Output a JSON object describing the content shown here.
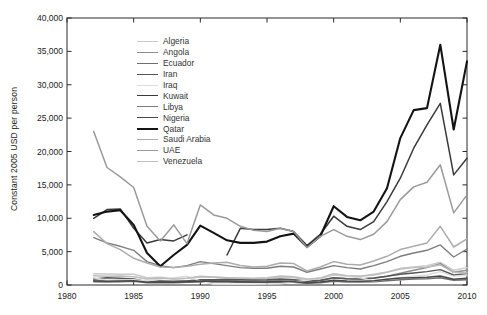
{
  "figure": {
    "ylabel": "Constant 2005 USD per person",
    "axis_color": "#2b2b2b",
    "background": "#ffffff"
  },
  "chart_data": {
    "type": "line",
    "title": "",
    "xlabel": "",
    "ylabel": "Constant 2005 USD per person",
    "xlim": [
      1980,
      2010
    ],
    "ylim": [
      0,
      40000
    ],
    "xticks": [
      1980,
      1985,
      1990,
      1995,
      2000,
      2005,
      2010
    ],
    "yticks": [
      0,
      5000,
      10000,
      15000,
      20000,
      25000,
      30000,
      35000,
      40000
    ],
    "ytick_labels": [
      "0",
      "5,000",
      "10,000",
      "15,000",
      "20,000",
      "25,000",
      "30,000",
      "35,000",
      "40,000"
    ],
    "grid": false,
    "legend_position": "upper-left-inside",
    "x": [
      1982,
      1983,
      1984,
      1985,
      1986,
      1987,
      1988,
      1989,
      1990,
      1991,
      1992,
      1993,
      1994,
      1995,
      1996,
      1997,
      1998,
      1999,
      2000,
      2001,
      2002,
      2003,
      2004,
      2005,
      2006,
      2007,
      2008,
      2009,
      2010
    ],
    "series": [
      {
        "name": "Algeria",
        "color": "#c9c9c9",
        "width": 1.4,
        "values": [
          1700,
          1650,
          1600,
          1600,
          1100,
          1150,
          900,
          1000,
          1200,
          1150,
          1100,
          1000,
          950,
          1000,
          1150,
          1100,
          800,
          1000,
          1500,
          1350,
          1300,
          1600,
          1950,
          2500,
          2700,
          2900,
          3400,
          2200,
          2600
        ]
      },
      {
        "name": "Angola",
        "color": "#8c8c8c",
        "width": 1.4,
        "values": [
          700,
          650,
          700,
          750,
          500,
          550,
          600,
          650,
          700,
          650,
          700,
          600,
          600,
          650,
          750,
          750,
          500,
          650,
          1100,
          950,
          900,
          1000,
          1300,
          1750,
          2200,
          2600,
          3200,
          1900,
          2200
        ]
      },
      {
        "name": "Ecuador",
        "color": "#6e6e6e",
        "width": 1.4,
        "values": [
          500,
          450,
          500,
          550,
          350,
          350,
          350,
          400,
          450,
          450,
          450,
          400,
          400,
          400,
          450,
          400,
          250,
          350,
          550,
          450,
          450,
          500,
          650,
          800,
          900,
          950,
          1100,
          700,
          800
        ]
      },
      {
        "name": "Iran",
        "color": "#575757",
        "width": 1.4,
        "values": [
          900,
          1100,
          1000,
          900,
          500,
          600,
          500,
          600,
          800,
          800,
          850,
          800,
          750,
          800,
          900,
          800,
          550,
          700,
          1100,
          950,
          900,
          1050,
          1300,
          1600,
          1800,
          2000,
          2300,
          1500,
          1700
        ]
      },
      {
        "name": "Iraq",
        "color": "#dcdcdc",
        "width": 1.4,
        "values": [
          1100,
          700,
          750,
          800,
          600,
          900,
          1100,
          1300,
          600,
          100,
          100,
          100,
          100,
          150,
          200,
          450,
          700,
          1100,
          1700,
          1300,
          1100,
          600,
          900,
          1100,
          1300,
          1500,
          2000,
          1300,
          1500
        ]
      },
      {
        "name": "Kuwait",
        "color": "#3a3a3a",
        "width": 1.5,
        "values": [
          10000,
          11300,
          11400,
          8500,
          6300,
          6800,
          6600,
          7500,
          null,
          null,
          4500,
          8500,
          8300,
          8300,
          8500,
          8000,
          5900,
          7600,
          10300,
          8800,
          8300,
          9500,
          12500,
          16000,
          20500,
          24000,
          27200,
          16500,
          19000
        ]
      },
      {
        "name": "Libya",
        "color": "#7d7d7d",
        "width": 1.4,
        "values": [
          7100,
          6300,
          5800,
          5200,
          3500,
          2900,
          2600,
          2900,
          3500,
          3200,
          2900,
          2600,
          2500,
          2500,
          2800,
          2700,
          1900,
          2400,
          2900,
          2600,
          2400,
          2900,
          3500,
          4300,
          4800,
          5200,
          6000,
          4200,
          5400
        ]
      },
      {
        "name": "Nigeria",
        "color": "#494949",
        "width": 1.4,
        "values": [
          600,
          550,
          600,
          650,
          400,
          450,
          400,
          500,
          600,
          550,
          550,
          500,
          450,
          450,
          550,
          500,
          350,
          450,
          700,
          600,
          550,
          650,
          850,
          1050,
          1100,
          1150,
          1350,
          850,
          1000
        ]
      },
      {
        "name": "Qatar",
        "color": "#141414",
        "width": 2.1,
        "values": [
          10500,
          11000,
          11200,
          9000,
          4800,
          2800,
          4500,
          6000,
          8900,
          7800,
          6700,
          6300,
          6300,
          6500,
          7300,
          7700,
          5700,
          7300,
          11800,
          10200,
          9700,
          11000,
          14500,
          22000,
          26200,
          26500,
          36000,
          23300,
          33500
        ]
      },
      {
        "name": "Saudi Arabia",
        "color": "#acacac",
        "width": 1.5,
        "values": [
          8000,
          6200,
          5300,
          4000,
          3300,
          2700,
          2600,
          2800,
          3100,
          3300,
          3400,
          2900,
          2700,
          2800,
          3300,
          3200,
          2100,
          2700,
          3500,
          3100,
          3000,
          3600,
          4300,
          5300,
          5800,
          6300,
          8800,
          5700,
          6900
        ]
      },
      {
        "name": "UAE",
        "color": "#9a9a9a",
        "width": 1.5,
        "values": [
          23000,
          17600,
          16200,
          14600,
          8800,
          6600,
          9000,
          6200,
          12000,
          10500,
          10000,
          8800,
          8200,
          8000,
          8500,
          8000,
          5600,
          7300,
          8300,
          7300,
          6800,
          7600,
          9500,
          12800,
          14700,
          15400,
          18000,
          10800,
          13500
        ]
      },
      {
        "name": "Venezuela",
        "color": "#bdbdbd",
        "width": 1.4,
        "values": [
          1400,
          1300,
          1350,
          1250,
          900,
          1050,
          900,
          1000,
          1300,
          1200,
          1100,
          1050,
          1000,
          1100,
          1350,
          1250,
          900,
          1000,
          1700,
          1400,
          1300,
          1500,
          1900,
          2400,
          2600,
          2700,
          3000,
          1900,
          1800
        ]
      }
    ]
  }
}
